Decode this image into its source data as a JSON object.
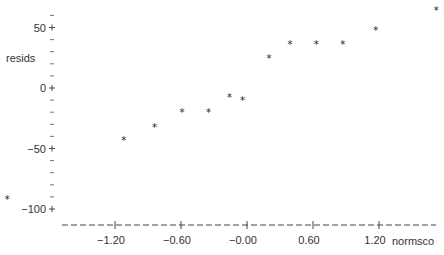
{
  "chart_data": {
    "type": "scatter",
    "title": "",
    "xlabel": "normsco",
    "ylabel": "resids",
    "marker": "*",
    "xlim": [
      -2.25,
      1.75
    ],
    "ylim": [
      -108,
      70
    ],
    "x_ticks": [
      -1.2,
      -0.6,
      0.0,
      0.6,
      1.2
    ],
    "x_tick_labels": [
      "-1.20",
      "-0.60",
      "-0.00",
      "0.60",
      "1.20"
    ],
    "y_ticks": [
      50,
      0,
      -50,
      -100
    ],
    "y_tick_labels": [
      "50",
      "0",
      "-50",
      "-100"
    ],
    "grid": false,
    "points": [
      {
        "x": -2.18,
        "y": -91
      },
      {
        "x": -1.12,
        "y": -42
      },
      {
        "x": -0.84,
        "y": -31
      },
      {
        "x": -0.59,
        "y": -19
      },
      {
        "x": -0.35,
        "y": -19
      },
      {
        "x": -0.16,
        "y": -7
      },
      {
        "x": -0.04,
        "y": -9
      },
      {
        "x": 0.2,
        "y": 26
      },
      {
        "x": 0.39,
        "y": 37
      },
      {
        "x": 0.63,
        "y": 37
      },
      {
        "x": 0.87,
        "y": 37
      },
      {
        "x": 1.17,
        "y": 49
      },
      {
        "x": 1.72,
        "y": 65
      }
    ]
  }
}
